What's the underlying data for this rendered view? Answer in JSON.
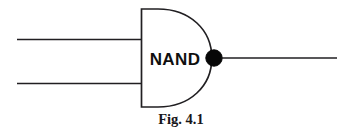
{
  "figure": {
    "caption": "Fig. 4.1",
    "gate": {
      "label": "NAND",
      "type": "nand-gate",
      "inputs": [
        {
          "name": "input-line-top"
        },
        {
          "name": "input-line-bottom"
        }
      ],
      "output": {
        "name": "output-line"
      },
      "inverter_bubble": {
        "name": "inversion-bubble"
      }
    },
    "colors": {
      "background": "#ffffff",
      "stroke": "#211f22",
      "label_text": "#100f0f",
      "caption_text": "#17161a",
      "bubble_fill": "#070707"
    }
  }
}
